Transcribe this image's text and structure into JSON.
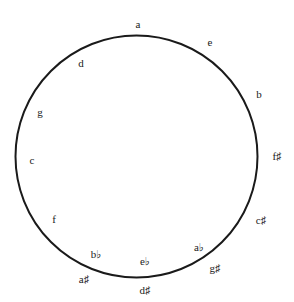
{
  "diagram": {
    "type": "circle-of-fifths",
    "circle": {
      "cx": 136.5,
      "cy": 156.5,
      "r": 121,
      "stroke": "#1a1a1a",
      "stroke_width": 2
    },
    "labels": [
      {
        "text": "a",
        "x": 138,
        "y": 24
      },
      {
        "text": "e",
        "x": 210,
        "y": 42
      },
      {
        "text": "d",
        "x": 81,
        "y": 63
      },
      {
        "text": "b",
        "x": 259,
        "y": 94
      },
      {
        "text": "g",
        "x": 40,
        "y": 112
      },
      {
        "text": "c",
        "x": 32,
        "y": 160
      },
      {
        "text": "f♯",
        "x": 277,
        "y": 156
      },
      {
        "text": "f",
        "x": 54,
        "y": 219
      },
      {
        "text": "c♯",
        "x": 261,
        "y": 220
      },
      {
        "text": "a♭",
        "x": 199,
        "y": 247
      },
      {
        "text": "b♭",
        "x": 96,
        "y": 254
      },
      {
        "text": "e♭",
        "x": 145,
        "y": 261
      },
      {
        "text": "g♯",
        "x": 215,
        "y": 268
      },
      {
        "text": "a♯",
        "x": 84,
        "y": 279
      },
      {
        "text": "d♯",
        "x": 145,
        "y": 290
      }
    ]
  }
}
